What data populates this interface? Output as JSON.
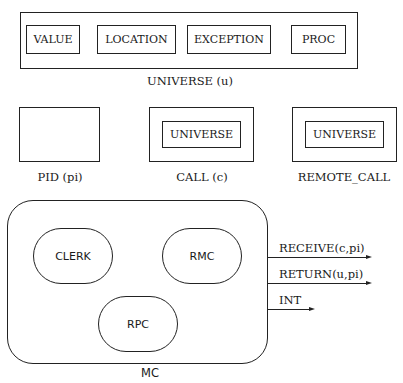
{
  "universe": {
    "label": "UNIVERSE (u)",
    "members": [
      "VALUE",
      "LOCATION",
      "EXCEPTION",
      "PROC"
    ]
  },
  "pid": {
    "label": "PID (pi)"
  },
  "call": {
    "inner": "UNIVERSE",
    "label": "CALL (c)"
  },
  "remote_call": {
    "inner": "UNIVERSE",
    "label": "REMOTE_CALL"
  },
  "mc": {
    "label": "MC",
    "components": [
      "CLERK",
      "RMC",
      "RPC"
    ],
    "outputs": [
      "RECEIVE(c,pi)",
      "RETURN(u,pi)",
      "INT"
    ]
  }
}
